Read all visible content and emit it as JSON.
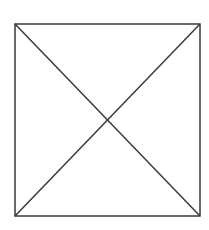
{
  "diagram": {
    "type": "square-with-diagonals",
    "square": {
      "x1": 15,
      "y1": 24,
      "x2": 200,
      "y2": 216
    },
    "stroke_color": "#3a3a3a",
    "background_color": "#ffffff",
    "stroke_width": 1.5,
    "diagonals": [
      {
        "from": [
          15,
          24
        ],
        "to": [
          200,
          216
        ]
      },
      {
        "from": [
          200,
          24
        ],
        "to": [
          15,
          216
        ]
      }
    ],
    "labels": []
  }
}
